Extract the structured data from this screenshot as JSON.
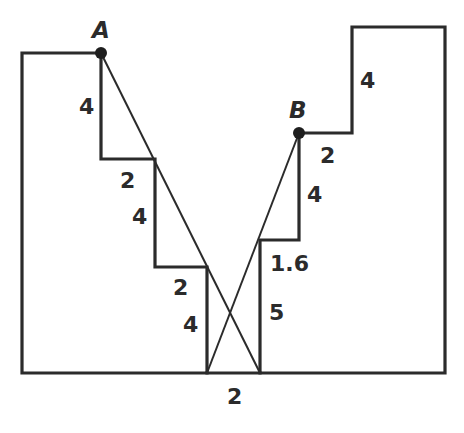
{
  "diagram": {
    "type": "stepped-profile-with-crossing-segments",
    "points": {
      "A": {
        "label": "A"
      },
      "B": {
        "label": "B"
      }
    },
    "left_steps": {
      "rise_top": "4",
      "run_1": "2",
      "rise_mid": "4",
      "run_2": "2",
      "rise_bottom": "4"
    },
    "right_steps": {
      "rise_top": "4",
      "run_top": "2",
      "rise_mid": "4",
      "run_mid": "1.6",
      "rise_bottom": "5"
    },
    "bottom_gap": "2",
    "colors": {
      "line": "#2b2b2b",
      "background": "#ffffff"
    }
  }
}
